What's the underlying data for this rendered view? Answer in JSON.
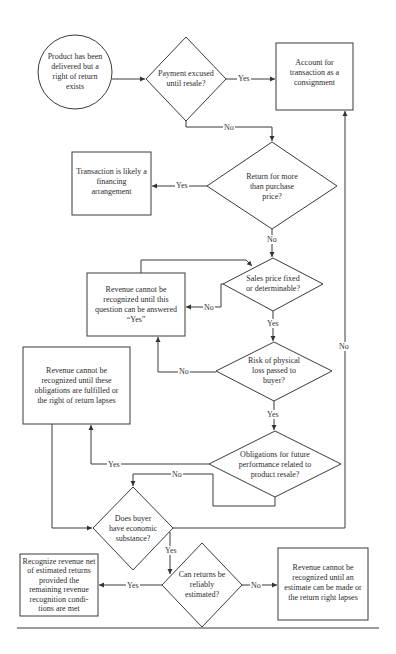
{
  "diagram": {
    "type": "flowchart",
    "nodes": {
      "start": {
        "shape": "circle",
        "text": "Product has been delivered but a right of return exists"
      },
      "q_payment": {
        "shape": "diamond",
        "text": "Payment excused until resale?"
      },
      "consignment": {
        "shape": "box",
        "text": "Account for transaction as a consignment"
      },
      "q_return_more": {
        "shape": "diamond",
        "text": "Return for more than purchase price?"
      },
      "financing": {
        "shape": "box",
        "text": "Transaction is likely a financing arrangement"
      },
      "q_sales_price": {
        "shape": "diamond",
        "text": "Sales price fixed or determinable?"
      },
      "cannot_until_yes": {
        "shape": "box",
        "text": "Revenue cannot be recognized until this question can be answered “Yes”"
      },
      "q_risk": {
        "shape": "diamond",
        "text": "Risk of physical loss passed to buyer?"
      },
      "cannot_obligations": {
        "shape": "box",
        "text": "Revenue cannot be recognized until these obligations are fulfilled or the right of return lapses"
      },
      "q_obligations": {
        "shape": "diamond",
        "text": "Obligations for future performance related to product resale?"
      },
      "q_economic": {
        "shape": "diamond",
        "text": "Does buyer have economic substance?"
      },
      "q_estimate": {
        "shape": "diamond",
        "text": "Can returns be reliably estimated?"
      },
      "recognize_net": {
        "shape": "box",
        "text": "Recognize revenue net of estimated returns provided the remaining revenue recognition condi-tions are met"
      },
      "cannot_estimate": {
        "shape": "box",
        "text": "Revenue cannot be recognized until an estimate can be made or the return right lapses"
      }
    },
    "edges": [
      {
        "from": "start",
        "to": "q_payment",
        "label": ""
      },
      {
        "from": "q_payment",
        "to": "consignment",
        "label": "Yes"
      },
      {
        "from": "q_payment",
        "to": "q_return_more",
        "label": "No"
      },
      {
        "from": "q_return_more",
        "to": "financing",
        "label": "Yes"
      },
      {
        "from": "q_return_more",
        "to": "q_sales_price",
        "label": "No"
      },
      {
        "from": "q_sales_price",
        "to": "cannot_until_yes",
        "label": "No"
      },
      {
        "from": "cannot_until_yes",
        "to": "q_sales_price",
        "label": ""
      },
      {
        "from": "q_sales_price",
        "to": "q_risk",
        "label": "Yes"
      },
      {
        "from": "q_risk",
        "to": "cannot_until_yes",
        "label": "No"
      },
      {
        "from": "q_risk",
        "to": "q_obligations",
        "label": "Yes"
      },
      {
        "from": "q_obligations",
        "to": "cannot_obligations",
        "label": "Yes"
      },
      {
        "from": "q_obligations",
        "to": "q_economic",
        "label": "No"
      },
      {
        "from": "cannot_obligations",
        "to": "q_economic",
        "label": ""
      },
      {
        "from": "q_economic",
        "to": "consignment",
        "label": "No"
      },
      {
        "from": "q_economic",
        "to": "q_estimate",
        "label": "Yes"
      },
      {
        "from": "q_estimate",
        "to": "recognize_net",
        "label": "Yes"
      },
      {
        "from": "q_estimate",
        "to": "cannot_estimate",
        "label": "No"
      }
    ],
    "labels": {
      "yes": "Yes",
      "no": "No"
    },
    "colors": {
      "stroke": "#3a3a3a",
      "text": "#2b2b2b",
      "background": "#ffffff"
    }
  }
}
